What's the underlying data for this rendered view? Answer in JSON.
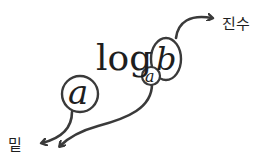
{
  "diagram": {
    "expression": {
      "log_text": "log",
      "base_symbol": "a",
      "argument_symbol": "b"
    },
    "isolated_base_symbol": "a",
    "labels": {
      "argument_label": "진수",
      "base_label": "밑"
    },
    "colors": {
      "stroke": "#3a3a3a",
      "text": "#1e1e1e",
      "background": "#ffffff"
    }
  }
}
